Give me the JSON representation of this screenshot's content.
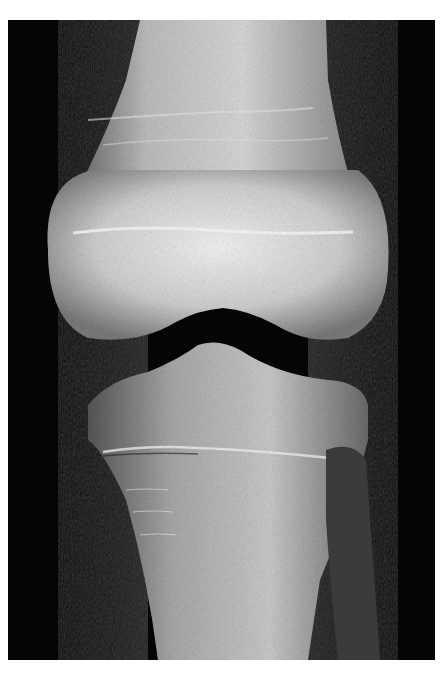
{
  "image": {
    "subject": "knee-xray-ap-view",
    "background_color": "#ffffff",
    "film_color": "#050505",
    "bone_color": "#d8d8d8"
  }
}
